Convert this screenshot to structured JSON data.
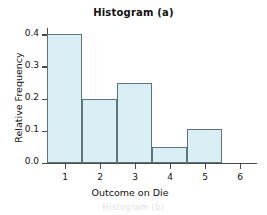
{
  "chart_data": {
    "type": "bar",
    "title": "Histogram (a)",
    "xlabel": "Outcome on Die",
    "ylabel": "Relative Frequency",
    "categories": [
      "1",
      "2",
      "3",
      "4",
      "5",
      "6"
    ],
    "values": [
      0.4,
      0.2,
      0.25,
      0.05,
      0.105,
      0.0
    ],
    "xlim": [
      0.5,
      6.5
    ],
    "ylim": [
      0.0,
      0.42
    ],
    "ytick_labels": [
      "0.0",
      "0.1",
      "0.2",
      "0.3",
      "0.4"
    ],
    "ytick_values": [
      0.0,
      0.1,
      0.2,
      0.3,
      0.4
    ],
    "xtick_labels": [
      "1",
      "2",
      "3",
      "4",
      "5",
      "6"
    ],
    "grid": false,
    "legend": null,
    "bar_fill_color": "#d9eef5",
    "bar_edge_color": "#5e7479",
    "axis_color": "#4a4a4a",
    "background_color": "#ffffff",
    "bar_width": 1.0
  },
  "footer": {
    "ghost_text": "Histogram (b)"
  }
}
